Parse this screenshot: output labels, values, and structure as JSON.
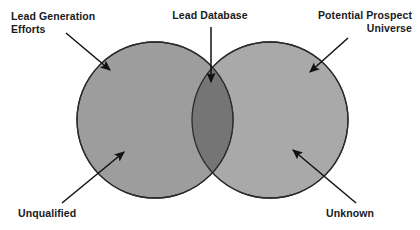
{
  "diagram": {
    "type": "venn",
    "title": "",
    "background_color": "#ffffff",
    "sets": [
      {
        "id": "left",
        "name": "Lead Generation Efforts",
        "fill_color": "#9d9d9d",
        "stroke_color": "#2b2b2b",
        "center_x": 155,
        "center_y": 120,
        "radius": 78
      },
      {
        "id": "right",
        "name": "Potential Prospect Universe",
        "fill_color": "#a9a9a9",
        "stroke_color": "#2b2b2b",
        "center_x": 270,
        "center_y": 120,
        "radius": 78
      }
    ],
    "intersection": {
      "name": "Lead Database",
      "fill_color": "#757575"
    },
    "arrow_color": "#111111"
  },
  "labels": {
    "lead_generation_efforts": "Lead Generation\nEfforts",
    "lead_database": "Lead Database",
    "potential_prospect_universe": "Potential Prospect\nUniverse",
    "unqualified": "Unqualified",
    "unknown": "Unknown"
  }
}
